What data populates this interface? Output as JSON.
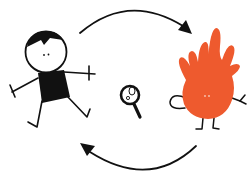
{
  "illustration": {
    "description": "Cycle diagram: child, magnifying glass, orange splat monster, connected by two curved arrows",
    "colors": {
      "ink": "#111111",
      "monster": "#EE5A2E",
      "background": "#ffffff"
    },
    "nodes": [
      {
        "id": "child",
        "label": "stick-figure child",
        "position": "left"
      },
      {
        "id": "magnifier",
        "label": "magnifying glass",
        "position": "center"
      },
      {
        "id": "monster",
        "label": "orange splat monster",
        "position": "right"
      }
    ],
    "edges": [
      {
        "from": "child",
        "to": "monster",
        "route": "top arc"
      },
      {
        "from": "monster",
        "to": "child",
        "route": "bottom arc"
      }
    ]
  }
}
